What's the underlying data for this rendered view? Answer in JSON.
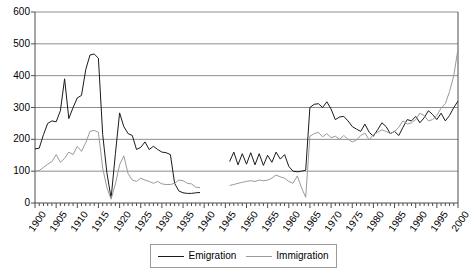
{
  "chart_data": {
    "type": "line",
    "title": "",
    "xlabel": "",
    "ylabel": "",
    "xlim": [
      1900,
      2000
    ],
    "ylim": [
      0,
      600
    ],
    "yticks": [
      0,
      100,
      200,
      300,
      400,
      500,
      600
    ],
    "xticks": [
      1900,
      1905,
      1910,
      1915,
      1920,
      1925,
      1930,
      1935,
      1940,
      1945,
      1950,
      1955,
      1960,
      1965,
      1970,
      1975,
      1980,
      1985,
      1990,
      1995,
      2000
    ],
    "minor_xtick_interval": 1,
    "grid": "horizontal",
    "legend_position": "bottom",
    "series": [
      {
        "name": "Emigration",
        "color": "#1a1a1a",
        "x": [
          1900,
          1901,
          1902,
          1903,
          1904,
          1905,
          1906,
          1907,
          1908,
          1909,
          1910,
          1911,
          1912,
          1913,
          1914,
          1915,
          1916,
          1917,
          1918,
          1919,
          1920,
          1921,
          1922,
          1923,
          1924,
          1925,
          1926,
          1927,
          1928,
          1929,
          1930,
          1931,
          1932,
          1933,
          1934,
          1935,
          1936,
          1937,
          1938,
          1939,
          1946,
          1947,
          1948,
          1949,
          1950,
          1951,
          1952,
          1953,
          1954,
          1955,
          1956,
          1957,
          1958,
          1959,
          1960,
          1961,
          1962,
          1963,
          1964,
          1965,
          1966,
          1967,
          1968,
          1969,
          1970,
          1971,
          1972,
          1973,
          1974,
          1975,
          1976,
          1977,
          1978,
          1979,
          1980,
          1981,
          1982,
          1983,
          1984,
          1985,
          1986,
          1987,
          1988,
          1989,
          1990,
          1991,
          1992,
          1993,
          1994,
          1995,
          1996,
          1997,
          1998,
          1999,
          2000
        ],
        "values": [
          170,
          172,
          215,
          250,
          258,
          255,
          290,
          390,
          265,
          300,
          330,
          338,
          420,
          465,
          468,
          455,
          215,
          95,
          15,
          155,
          283,
          240,
          218,
          212,
          168,
          175,
          192,
          168,
          178,
          168,
          160,
          158,
          152,
          62,
          38,
          32,
          30,
          30,
          32,
          33,
          130,
          160,
          120,
          155,
          122,
          158,
          120,
          155,
          118,
          150,
          128,
          160,
          138,
          152,
          115,
          100,
          98,
          100,
          103,
          300,
          310,
          312,
          300,
          318,
          295,
          262,
          270,
          272,
          258,
          240,
          232,
          225,
          248,
          222,
          210,
          230,
          252,
          240,
          218,
          225,
          212,
          238,
          262,
          258,
          272,
          252,
          268,
          290,
          278,
          262,
          282,
          258,
          275,
          300,
          320
        ]
      },
      {
        "name": "Immigration",
        "color": "#9a9a9a",
        "x": [
          1900,
          1901,
          1902,
          1903,
          1904,
          1905,
          1906,
          1907,
          1908,
          1909,
          1910,
          1911,
          1912,
          1913,
          1914,
          1915,
          1916,
          1917,
          1918,
          1919,
          1920,
          1921,
          1922,
          1923,
          1924,
          1925,
          1926,
          1927,
          1928,
          1929,
          1930,
          1931,
          1932,
          1933,
          1934,
          1935,
          1936,
          1937,
          1938,
          1939,
          1946,
          1947,
          1948,
          1949,
          1950,
          1951,
          1952,
          1953,
          1954,
          1955,
          1956,
          1957,
          1958,
          1959,
          1960,
          1961,
          1962,
          1963,
          1964,
          1965,
          1966,
          1967,
          1968,
          1969,
          1970,
          1971,
          1972,
          1973,
          1974,
          1975,
          1976,
          1977,
          1978,
          1979,
          1980,
          1981,
          1982,
          1983,
          1984,
          1985,
          1986,
          1987,
          1988,
          1989,
          1990,
          1991,
          1992,
          1993,
          1994,
          1995,
          1996,
          1997,
          1998,
          1999,
          2000
        ],
        "values": [
          100,
          102,
          112,
          122,
          130,
          152,
          128,
          140,
          160,
          152,
          178,
          162,
          190,
          225,
          228,
          222,
          110,
          48,
          12,
          60,
          120,
          148,
          92,
          72,
          68,
          78,
          72,
          68,
          62,
          68,
          60,
          58,
          58,
          62,
          72,
          70,
          62,
          60,
          50,
          48,
          55,
          58,
          62,
          65,
          68,
          70,
          68,
          72,
          70,
          72,
          78,
          88,
          82,
          78,
          68,
          62,
          85,
          48,
          18,
          210,
          218,
          222,
          208,
          218,
          205,
          210,
          200,
          212,
          200,
          192,
          198,
          212,
          220,
          198,
          215,
          222,
          230,
          225,
          218,
          225,
          238,
          258,
          248,
          252,
          262,
          282,
          275,
          258,
          262,
          275,
          298,
          312,
          350,
          400,
          485
        ]
      }
    ]
  },
  "legend": {
    "items": [
      {
        "label": "Emigration",
        "color": "#1a1a1a"
      },
      {
        "label": "Immigration",
        "color": "#9a9a9a"
      }
    ]
  },
  "axes": {
    "y_labels": [
      "0",
      "100",
      "200",
      "300",
      "400",
      "500",
      "600"
    ],
    "x_labels": [
      "1900",
      "1905",
      "1910",
      "1915",
      "1920",
      "1925",
      "1930",
      "1935",
      "1940",
      "1945",
      "1950",
      "1955",
      "1960",
      "1965",
      "1970",
      "1975",
      "1980",
      "1985",
      "1990",
      "1995",
      "2000"
    ]
  }
}
